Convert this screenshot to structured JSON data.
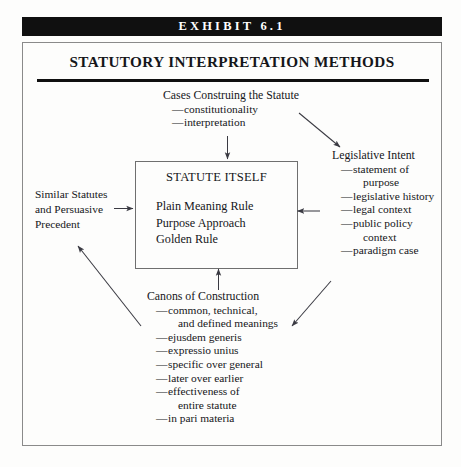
{
  "exhibit": {
    "banner_label": "EXHIBIT 6.1",
    "title": "STATUTORY INTERPRETATION METHODS"
  },
  "colors": {
    "banner_background": "#101010",
    "banner_text": "#ffffff",
    "page_background": "#fdfdfc",
    "frame_border": "#8a8a8a",
    "text": "#15161a",
    "rule": "#101010",
    "arrow": "#3a3a42"
  },
  "center_box": {
    "heading": "STATUTE ITSELF",
    "rules": [
      "Plain Meaning Rule",
      "Purpose Approach",
      "Golden Rule"
    ]
  },
  "blocks": {
    "cases": {
      "heading": "Cases Construing the Statute",
      "items": [
        {
          "text": "constitutionality",
          "dash": true
        },
        {
          "text": "interpretation",
          "dash": true
        }
      ]
    },
    "legislative_intent": {
      "heading": "Legislative Intent",
      "items": [
        {
          "text": "statement of",
          "dash": true
        },
        {
          "text": "purpose",
          "dash": false
        },
        {
          "text": "legislative history",
          "dash": true
        },
        {
          "text": "legal context",
          "dash": true
        },
        {
          "text": "public policy",
          "dash": true
        },
        {
          "text": "context",
          "dash": false
        },
        {
          "text": "paradigm case",
          "dash": true
        }
      ]
    },
    "similar_statutes": {
      "lines": [
        "Similar Statutes",
        "and Persuasive",
        "Precedent"
      ]
    },
    "canons": {
      "heading": "Canons of Construction",
      "items": [
        {
          "text": "common, technical,",
          "dash": true
        },
        {
          "text": "and defined meanings",
          "dash": false
        },
        {
          "text": "ejusdem generis",
          "dash": true
        },
        {
          "text": "expressio unius",
          "dash": true
        },
        {
          "text": "specific over general",
          "dash": true
        },
        {
          "text": "later over earlier",
          "dash": true
        },
        {
          "text": "effectiveness of",
          "dash": true
        },
        {
          "text": "entire statute",
          "dash": false
        },
        {
          "text": "in pari materia",
          "dash": true
        }
      ]
    }
  },
  "arrows": [
    {
      "name": "cases-to-statute",
      "from": "Cases Construing the Statute",
      "to": "STATUTE ITSELF",
      "direction": "down"
    },
    {
      "name": "cases-to-legislative-intent",
      "from": "Cases Construing the Statute",
      "to": "Legislative Intent",
      "direction": "down-right"
    },
    {
      "name": "similar-statutes-to-statute",
      "from": "Similar Statutes and Persuasive Precedent",
      "to": "STATUTE ITSELF",
      "direction": "right"
    },
    {
      "name": "legislative-intent-to-statute",
      "from": "Legislative Intent",
      "to": "STATUTE ITSELF",
      "direction": "left"
    },
    {
      "name": "canons-to-statute",
      "from": "Canons of Construction",
      "to": "STATUTE ITSELF",
      "direction": "up"
    },
    {
      "name": "canons-to-similar-statutes",
      "from": "Canons of Construction",
      "to": "Similar Statutes and Persuasive Precedent",
      "direction": "up-left"
    },
    {
      "name": "legislative-intent-to-canons",
      "from": "Legislative Intent",
      "to": "Canons of Construction",
      "direction": "down-left"
    }
  ]
}
